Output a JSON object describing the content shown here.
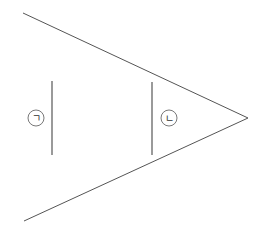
{
  "diagram": {
    "colors": {
      "background": "#ffffff",
      "ray_line": "#555555",
      "segment": "#9a9a9a",
      "label_circle": "#555555",
      "label_text": "#333333"
    },
    "vertex": {
      "x": 248,
      "y": 118
    },
    "rays": [
      {
        "name": "upper-ray",
        "x1": 23,
        "y1": 13,
        "x2": 248,
        "y2": 118
      },
      {
        "name": "lower-ray",
        "x1": 24,
        "y1": 221,
        "x2": 248,
        "y2": 118
      }
    ],
    "segments": [
      {
        "name": "segment-a",
        "x": 52,
        "y1": 81,
        "y2": 155,
        "label": "ㄱ",
        "label_cx": 36,
        "label_cy": 118
      },
      {
        "name": "segment-b",
        "x": 152,
        "y1": 82,
        "y2": 155,
        "label": "ㄴ",
        "label_cx": 169,
        "label_cy": 118
      }
    ],
    "label_radius": 8
  }
}
